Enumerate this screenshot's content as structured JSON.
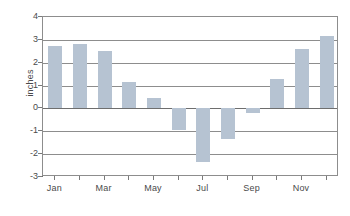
{
  "chart_data": {
    "type": "bar",
    "title": "",
    "subtitle": "",
    "xlabel": "",
    "ylabel": "inches",
    "categories": [
      "Jan",
      "Feb",
      "Mar",
      "Apr",
      "May",
      "Jun",
      "Jul",
      "Aug",
      "Sep",
      "Oct",
      "Nov",
      "Dec"
    ],
    "values": [
      2.75,
      2.8,
      2.5,
      1.15,
      0.45,
      -0.95,
      -2.35,
      -1.35,
      -0.2,
      1.3,
      2.6,
      3.15
    ],
    "series": [
      {
        "name": "inches",
        "values": [
          2.75,
          2.8,
          2.5,
          1.15,
          0.45,
          -0.95,
          -2.35,
          -1.35,
          -0.2,
          1.3,
          2.6,
          3.15
        ]
      }
    ],
    "ylim": [
      -3,
      4
    ],
    "yticks": [
      4,
      3,
      2,
      1,
      0,
      -1,
      -2,
      -3
    ],
    "ytick_labels": [
      "4",
      "3",
      "2",
      "1",
      "0",
      "-1",
      "-2",
      "-3"
    ],
    "xtick_labels": [
      "Jan",
      "Mar",
      "May",
      "Jul",
      "Sep",
      "Nov"
    ],
    "xtick_categories": [
      "Jan",
      "Mar",
      "May",
      "Jul",
      "Sep",
      "Nov"
    ],
    "grid": true,
    "grid_axis": "y",
    "legend": false,
    "legend_position": "none",
    "bar_color": "#b6c3d2",
    "axis_color": "#8d8d8d",
    "text_color": "#4a4a4a",
    "background_color": "#ffffff",
    "zero_line": 0
  }
}
